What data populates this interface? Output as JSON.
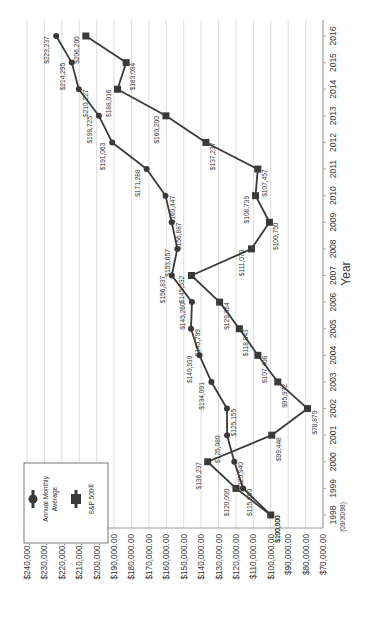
{
  "chart_data": {
    "type": "line",
    "orientation": "rotated-90-clockwise",
    "title": "",
    "xlabel": "Year",
    "ylabel": "",
    "categories": [
      "1998",
      "1999",
      "2000",
      "2001",
      "2002",
      "2003",
      "2004",
      "2005",
      "2006",
      "2007",
      "2008",
      "2009",
      "2010",
      "2011",
      "2012",
      "2013",
      "2014",
      "2015",
      "2016"
    ],
    "category_sublabels": {
      "1998": "(09/30/98)"
    },
    "ylim": [
      70000,
      240000
    ],
    "y_ticks": [
      "$240,000.00",
      "$230,000.00",
      "$220,000.00",
      "$210,000.00",
      "$200,000.00",
      "$190,000.00",
      "$180,000.00",
      "$170,000.00",
      "$160,000.00",
      "$150,000.00",
      "$140,000.00",
      "$130,000.00",
      "$120,000.00",
      "$110,000.00",
      "$100,000.00",
      "$90,000.00",
      "$80,000.00",
      "$70,000.00"
    ],
    "y_tick_values": [
      240000,
      230000,
      220000,
      210000,
      200000,
      190000,
      180000,
      170000,
      160000,
      150000,
      140000,
      130000,
      120000,
      110000,
      100000,
      90000,
      80000,
      70000
    ],
    "grid": true,
    "legend_position": "upper-left (rotated)",
    "series": [
      {
        "name": "Annual Monthly Average",
        "marker": "circle",
        "values": [
          100000,
          115890,
          120940,
          125080,
          125155,
          134091,
          140930,
          145799,
          145260,
          156837,
          153657,
          156887,
          160447,
          171288,
          191063,
          198725,
          210227,
          214295,
          223237
        ],
        "labels": [
          "$100,000",
          "$115,890",
          "$120,940",
          "$125,080",
          "$125,155",
          "$134,091",
          "$140,930",
          "$145,799",
          "$145,260",
          "$156,837",
          "$153,657",
          "$156,887",
          "$160,447",
          "$171,288",
          "$191,063",
          "$198,725",
          "$210,227",
          "$214,295",
          "$223,237"
        ]
      },
      {
        "name": "S&P 500®",
        "marker": "square",
        "values": [
          100000,
          120000,
          136237,
          99448,
          78879,
          95972,
          107408,
          118043,
          129364,
          145532,
          111073,
          100750,
          108739,
          107457,
          137237,
          160200,
          188016,
          183034,
          206200
        ],
        "labels": [
          "$100,000",
          "$120,000",
          "$136,237",
          "$99,448",
          "$78,879",
          "$95,972",
          "$107,408",
          "$118,043",
          "$129,364",
          "$145,532",
          "$111,073",
          "$100,750",
          "$108,739",
          "$107,457",
          "$137,237",
          "$160,200",
          "$188,016",
          "$183,034",
          "$206,200"
        ]
      }
    ]
  },
  "legend": {
    "items": [
      {
        "label_line1": "Annual Monthly",
        "label_line2": "Average",
        "marker": "circle"
      },
      {
        "label_line1": "S&P 500",
        "label_sup": "®",
        "marker": "square"
      }
    ]
  },
  "axis": {
    "x_title": "Year",
    "first_year_sublabel": "(09/30/98)"
  },
  "colors": {
    "line": "#3a3a3a",
    "grid": "#d4d4d4",
    "axis": "#9a9a9a",
    "text": "#333333",
    "legend_border": "#555555"
  }
}
